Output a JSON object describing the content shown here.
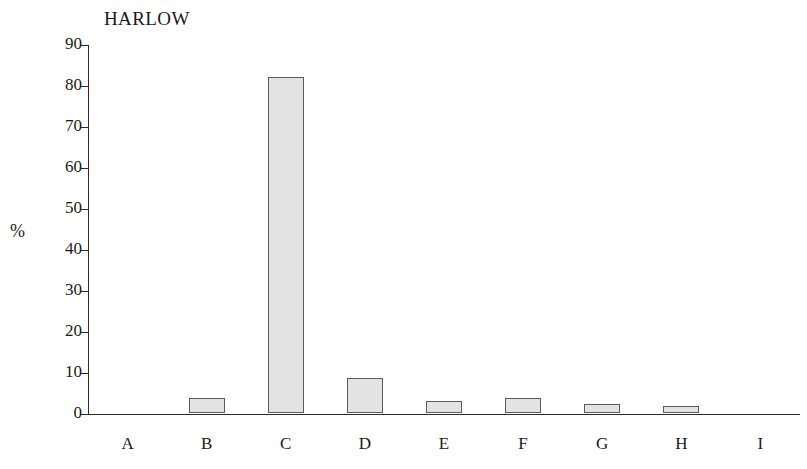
{
  "chart_data": {
    "type": "bar",
    "title": "HARLOW",
    "xlabel": "",
    "ylabel": "%",
    "categories": [
      "A",
      "B",
      "C",
      "D",
      "E",
      "F",
      "G",
      "H",
      "I"
    ],
    "values": [
      0,
      3.6,
      82,
      8.5,
      3.0,
      3.6,
      2.3,
      1.8,
      0
    ],
    "ylim": [
      0,
      90
    ],
    "ytick_labels": [
      "0",
      "10",
      "20",
      "30",
      "40",
      "50",
      "60",
      "70",
      "80",
      "90"
    ],
    "ytick_values": [
      0,
      10,
      20,
      30,
      40,
      50,
      60,
      70,
      80,
      90
    ],
    "grid": false,
    "legend": null,
    "bar_fill_color": "#e3e3e3",
    "bar_edge_color": "#5b5b5b",
    "axis_color": "#2b2b2b",
    "text_color": "#1a1a1a",
    "background_color": "#ffffff"
  }
}
